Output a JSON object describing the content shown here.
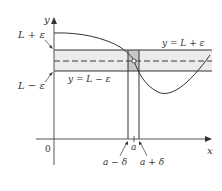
{
  "diagram": {
    "axes": {
      "x_label": "x",
      "y_label": "y",
      "origin_label": "0"
    },
    "horizontal_lines": {
      "upper_label_left": "L + ε",
      "lower_label_left": "L − ε",
      "upper_label_right": "y = L + ε",
      "lower_label_inline": "y = L − ε"
    },
    "x_markers": {
      "a": "a",
      "a_minus_delta": "a − δ",
      "a_plus_delta": "a + δ"
    },
    "colors": {
      "band_fill": "#ebebeb",
      "highlight_fill": "#c8c8c8",
      "line": "#333333",
      "dashed": "#777777",
      "curve": "#333333"
    }
  }
}
